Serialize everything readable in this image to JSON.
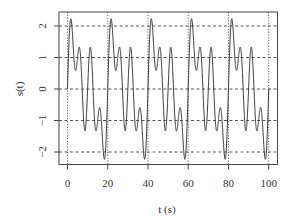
{
  "chart_data": {
    "type": "line",
    "title": "",
    "xlabel": "t (s)",
    "ylabel": "s(t)",
    "xlim": [
      0,
      100
    ],
    "ylim": [
      -2.3,
      2.3
    ],
    "x_ticks": [
      0,
      20,
      40,
      60,
      80,
      100
    ],
    "x_tick_labels": [
      "0",
      "20",
      "40",
      "60",
      "80",
      "100"
    ],
    "y_ticks": [
      -2,
      -1,
      0,
      1,
      2
    ],
    "y_tick_labels": [
      "−2",
      "−1",
      "0",
      "1",
      "2"
    ],
    "grid": {
      "horizontal": [
        -2,
        -1,
        0,
        1,
        2
      ],
      "horizontal_style": "dashed",
      "vertical": [
        0,
        20,
        40,
        60,
        80,
        100
      ],
      "vertical_style": "dotted"
    },
    "legend": null,
    "series": [
      {
        "name": "s(t)",
        "formula": "sin(2*pi*t/20) + sin(2*pi*t/10) + sin(2*pi*t/5)",
        "components": [
          {
            "amplitude": 1,
            "period": 20
          },
          {
            "amplitude": 1,
            "period": 10
          },
          {
            "amplitude": 1,
            "period": 5
          }
        ],
        "t_range": [
          0,
          100
        ],
        "key_points_per_period": [
          {
            "t": 0,
            "s": 0
          },
          {
            "t": 1.5,
            "s": 2.2
          },
          {
            "t": 4.1,
            "s": 0.6
          },
          {
            "t": 5.8,
            "s": 1.3
          },
          {
            "t": 9.0,
            "s": -1.3
          },
          {
            "t": 10,
            "s": 0
          },
          {
            "t": 11.0,
            "s": 1.3
          },
          {
            "t": 14.2,
            "s": -1.3
          },
          {
            "t": 15.9,
            "s": -0.6
          },
          {
            "t": 18.5,
            "s": -2.2
          },
          {
            "t": 20,
            "s": 0
          }
        ],
        "color": "#3a3a3a"
      }
    ],
    "colors": {
      "line": "#3a3a3a",
      "grid": "#555555",
      "axis": "#444444",
      "text": "#333333"
    }
  }
}
